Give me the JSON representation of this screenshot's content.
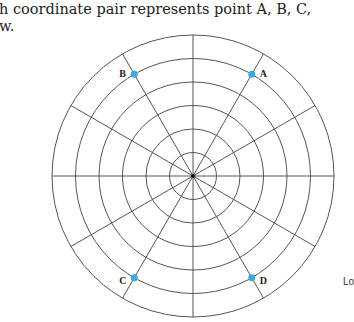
{
  "text": {
    "line1": "h coordinate pair represents point A, B, C,",
    "line2": "w.",
    "side_fragment": "Lo"
  },
  "polar_grid": {
    "center": [
      193,
      176
    ],
    "outer_radius": 141,
    "ring_count": 6,
    "radial_line_count": 12,
    "radial_line_step_deg": 30,
    "line_color": "#555555",
    "point_color": "#3BA9D9"
  },
  "points": [
    {
      "label": "A",
      "ring": 5,
      "angle_deg": 60
    },
    {
      "label": "B",
      "ring": 5,
      "angle_deg": 120
    },
    {
      "label": "C",
      "ring": 5,
      "angle_deg": 240
    },
    {
      "label": "D",
      "ring": 5,
      "angle_deg": 300
    }
  ]
}
